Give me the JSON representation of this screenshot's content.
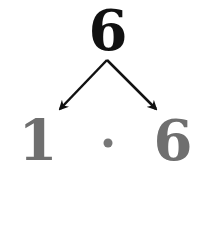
{
  "diagram": {
    "root": {
      "value": "6",
      "color": "#111111"
    },
    "factors": [
      {
        "value": "1",
        "color": "#6f6f6f"
      },
      {
        "value": "6",
        "color": "#6f6f6f"
      }
    ],
    "operator": {
      "symbol": "·",
      "meaning": "multiplication-dot",
      "color": "#777777"
    },
    "arrow_color": "#111111"
  }
}
